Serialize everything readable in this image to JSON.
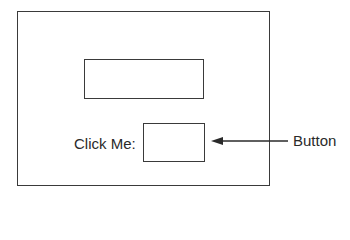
{
  "window": {
    "textbox": {
      "value": ""
    },
    "button": {
      "label": ""
    },
    "prompt_label": "Click Me:"
  },
  "annotations": {
    "button_callout": "Button"
  }
}
